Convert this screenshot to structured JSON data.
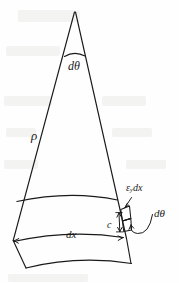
{
  "figure": {
    "name": "curved-beam-wedge-diagram",
    "stroke_color": "#1a1a1a",
    "background_color": "#fefefe",
    "labels": {
      "apex_angle": "dθ",
      "radius": "ρ",
      "strain_elongation": "ε",
      "strain_subscript": "y",
      "strain_suffix": "dx",
      "detail_angle": "dθ",
      "distance_c": "c",
      "element_length": "dx"
    }
  },
  "geometry": {
    "apex": {
      "x": 74,
      "y": 12
    },
    "left_edge_end": {
      "x": 13,
      "y": 240
    },
    "right_edge_end": {
      "x": 126,
      "y": 238
    },
    "apex_arc_y": 55,
    "band_top_arc_y": 200,
    "band_mid_arc_y": 242,
    "bottom_arc_y": 266
  },
  "colors": {
    "ink": "#1a1a1a",
    "paper": "#fefefe",
    "bleed_through": "#e9e9e6"
  }
}
